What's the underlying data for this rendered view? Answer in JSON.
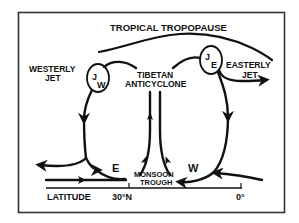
{
  "diagram": {
    "title": "TROPICAL TROPOPAUSE",
    "labels": {
      "westerly_jet_line1": "WESTERLY",
      "westerly_jet_line2": "JET",
      "easterly_jet_line1": "EASTERLY",
      "easterly_jet_line2": "JET",
      "tibetan_line1": "TIBETAN",
      "tibetan_line2": "ANTICYCLONE",
      "monsoon_line1": "MONSOON",
      "monsoon_line2": "TROUGH",
      "jet_west_main": "J",
      "jet_west_sub": "W",
      "jet_east_main": "J",
      "jet_east_sub": "E",
      "cell_east_marker": "E",
      "cell_west_marker": "W"
    },
    "axis": {
      "label": "LATITUDE",
      "ticks": [
        "30°N",
        "0°"
      ]
    },
    "colors": {
      "ink": "#111111",
      "background": "#ffffff",
      "frame": "#333333"
    }
  }
}
